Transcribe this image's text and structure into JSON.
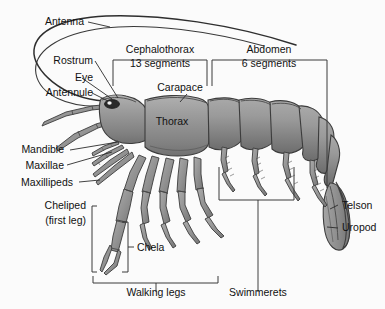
{
  "figure": {
    "background_color": "#fbfbfb",
    "body_fill": "#8e8e8e",
    "body_fill_light": "#a8a8a8",
    "body_fill_dark": "#6f6f6f",
    "outline_color": "#3c3c3c",
    "text_color": "#111111",
    "leader_color": "#2b2b2b"
  },
  "labels": {
    "antenna": "Antenna",
    "rostrum": "Rostrum",
    "eye": "Eye",
    "antennule": "Antennule",
    "mandible": "Mandible",
    "maxillae": "Maxillae",
    "maxillipeds": "Maxillipeds",
    "cheliped_line1": "Cheliped",
    "cheliped_line2": "(first leg)",
    "chela": "Chela",
    "walking_legs": "Walking legs",
    "swimmerets": "Swimmerets",
    "telson": "Telson",
    "uropod": "Uropod",
    "carapace": "Carapace",
    "thorax": "Thorax",
    "cephalothorax_line1": "Cephalothorax",
    "cephalothorax_line2": "13 segments",
    "abdomen_line1": "Abdomen",
    "abdomen_line2": "6 segments"
  },
  "regions": [
    {
      "name": "cephalothorax",
      "label": "Cephalothorax",
      "detail": "13 segments"
    },
    {
      "name": "abdomen",
      "label": "Abdomen",
      "detail": "6 segments"
    }
  ],
  "parts": [
    "Antenna",
    "Rostrum",
    "Eye",
    "Antennule",
    "Mandible",
    "Maxillae",
    "Maxillipeds",
    "Cheliped (first leg)",
    "Chela",
    "Walking legs",
    "Swimmerets",
    "Telson",
    "Uropod",
    "Carapace",
    "Thorax"
  ]
}
